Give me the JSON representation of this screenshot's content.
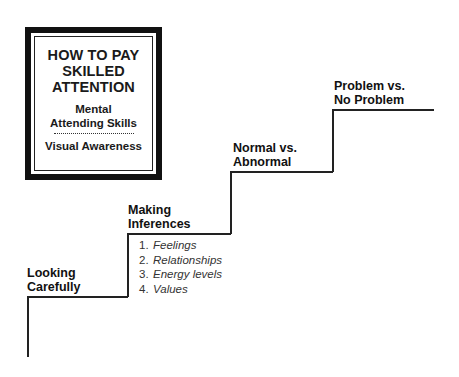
{
  "title_box": {
    "title_lines": [
      "HOW TO PAY",
      "SKILLED",
      "ATTENTION"
    ],
    "subtitle_lines": [
      "Mental",
      "Attending Skills"
    ],
    "separator": "dotted-line",
    "footer": "Visual Awareness"
  },
  "staircase": {
    "steps": [
      {
        "label_lines": [
          "Looking",
          "Carefully"
        ]
      },
      {
        "label_lines": [
          "Making",
          "Inferences"
        ],
        "items": [
          {
            "num": "1.",
            "text": "Feelings"
          },
          {
            "num": "2.",
            "text": "Relationships"
          },
          {
            "num": "3.",
            "text": "Energy levels"
          },
          {
            "num": "4.",
            "text": "Values"
          }
        ]
      },
      {
        "label_lines": [
          "Normal vs.",
          "Abnormal"
        ]
      },
      {
        "label_lines": [
          "Problem vs.",
          "No Problem"
        ]
      }
    ]
  },
  "colors": {
    "line": "#222222",
    "text": "#111111",
    "background": "#ffffff"
  }
}
